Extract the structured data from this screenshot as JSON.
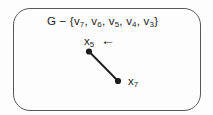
{
  "figure": {
    "expression": {
      "prefix": "G − {",
      "separator": ", ",
      "vertices": [
        {
          "base": "v",
          "sub": "7"
        },
        {
          "base": "v",
          "sub": "6"
        },
        {
          "base": "v",
          "sub": "5"
        },
        {
          "base": "v",
          "sub": "4"
        },
        {
          "base": "v",
          "sub": "3"
        }
      ],
      "suffix": "}"
    },
    "arrow_glyph": "←",
    "nodes": [
      {
        "base": "x",
        "sub": "5"
      },
      {
        "base": "x",
        "sub": "7"
      }
    ]
  },
  "colors": {
    "ink": "#1c1c1c",
    "border": "#585858",
    "background": "#fdfdfd"
  }
}
